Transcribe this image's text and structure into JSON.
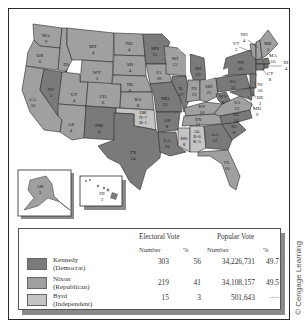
{
  "colors": {
    "democrat": "#7a7a7a",
    "republican": "#a0a0a0",
    "independent": "#c4c4c4",
    "border": "#2a2a2a"
  },
  "states": [
    {
      "abbr": "WA",
      "ev": "9"
    },
    {
      "abbr": "OR",
      "ev": "6"
    },
    {
      "abbr": "CA",
      "ev": "32"
    },
    {
      "abbr": "NV",
      "ev": "3"
    },
    {
      "abbr": "ID",
      "ev": "4"
    },
    {
      "abbr": "MT",
      "ev": "4"
    },
    {
      "abbr": "WY",
      "ev": "3"
    },
    {
      "abbr": "UT",
      "ev": "4"
    },
    {
      "abbr": "CO",
      "ev": "6"
    },
    {
      "abbr": "AZ",
      "ev": "4"
    },
    {
      "abbr": "NM",
      "ev": "4"
    },
    {
      "abbr": "ND",
      "ev": "4"
    },
    {
      "abbr": "SD",
      "ev": "4"
    },
    {
      "abbr": "NE",
      "ev": "6"
    },
    {
      "abbr": "KS",
      "ev": "8"
    },
    {
      "abbr": "OK",
      "ev": "N-7 B-1"
    },
    {
      "abbr": "TX",
      "ev": "24"
    },
    {
      "abbr": "MN",
      "ev": "11"
    },
    {
      "abbr": "IA",
      "ev": "10"
    },
    {
      "abbr": "MO",
      "ev": "13"
    },
    {
      "abbr": "AR",
      "ev": "8"
    },
    {
      "abbr": "LA",
      "ev": "10"
    },
    {
      "abbr": "WI",
      "ev": "12"
    },
    {
      "abbr": "IL",
      "ev": "27"
    },
    {
      "abbr": "MS",
      "ev": "8"
    },
    {
      "abbr": "MI",
      "ev": "20"
    },
    {
      "abbr": "IN",
      "ev": "13"
    },
    {
      "abbr": "OH",
      "ev": "25"
    },
    {
      "abbr": "KY",
      "ev": "10"
    },
    {
      "abbr": "TN",
      "ev": "11"
    },
    {
      "abbr": "AL",
      "ev": "K-5 B-6"
    },
    {
      "abbr": "GA",
      "ev": "12"
    },
    {
      "abbr": "FL",
      "ev": "10"
    },
    {
      "abbr": "SC",
      "ev": "8"
    },
    {
      "abbr": "NC",
      "ev": "14"
    },
    {
      "abbr": "VA",
      "ev": "12"
    },
    {
      "abbr": "WV",
      "ev": "8"
    },
    {
      "abbr": "PA",
      "ev": "32"
    },
    {
      "abbr": "NY",
      "ev": "45"
    },
    {
      "abbr": "VT",
      "ev": "3"
    },
    {
      "abbr": "NH",
      "ev": "4"
    },
    {
      "abbr": "ME",
      "ev": "5"
    },
    {
      "abbr": "MA",
      "ev": "16"
    },
    {
      "abbr": "RI",
      "ev": "4"
    },
    {
      "abbr": "CT",
      "ev": "8"
    },
    {
      "abbr": "NJ",
      "ev": "16"
    },
    {
      "abbr": "DE",
      "ev": "3"
    },
    {
      "abbr": "MD",
      "ev": "9"
    },
    {
      "abbr": "AK",
      "ev": "3"
    },
    {
      "abbr": "HI",
      "ev": "3"
    }
  ],
  "legend": {
    "electoral_header": "Electoral Vote",
    "popular_header": "Popular Vote",
    "number_label": "Number",
    "percent_label": "%",
    "rows": [
      {
        "name": "Kennedy",
        "party": "(Democrat)",
        "ev_number": "303",
        "ev_pct": "56",
        "pv_number": "34,226,731",
        "pv_pct": "49.7"
      },
      {
        "name": "Nixon",
        "party": "(Republican)",
        "ev_number": "219",
        "ev_pct": "41",
        "pv_number": "34,108,157",
        "pv_pct": "49.5"
      },
      {
        "name": "Byrd",
        "party": "(Independent)",
        "ev_number": "15",
        "ev_pct": "3",
        "pv_number": "501,643",
        "pv_pct": "----"
      }
    ]
  },
  "credit": "© Cengage Learning"
}
